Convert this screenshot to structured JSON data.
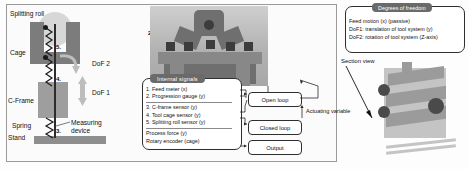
{
  "schematic": {
    "labels": {
      "splitting_roll": "Splitting roll",
      "cage": "Cage",
      "cframe": "C-Frame",
      "spring": "Spring",
      "stand": "Stand",
      "measuring_device": "Measuring device",
      "dof1": "DoF 1",
      "dof2": "DoF 2"
    },
    "callouts": {
      "n3": "3.",
      "n4": "4.",
      "n5": "5."
    }
  },
  "machine": {
    "gauge_number": "1.",
    "plate_callout": "2.",
    "axis_y": "Y",
    "axis_x": "X"
  },
  "internal_signals": {
    "title": "Internal signals",
    "group_a": [
      "1. Feed meter (x)",
      "2. Progression gauge (y)"
    ],
    "group_b": [
      "3. C-frame sensor (y)",
      "4. Tool cage sensor (y)",
      "5. Splitting roll sensor (y)"
    ],
    "group_c": [
      "Process force (y)",
      "Rotary encoder (cage)"
    ]
  },
  "flow": {
    "open_loop": "Open loop",
    "closed_loop": "Closed loop",
    "output": "Output",
    "actuating_variable": "Actuating variable"
  },
  "degrees_of_freedom": {
    "title": "Degrees of freedom",
    "items": [
      "Feed motion (x) (passive)",
      "DoF1: translation of tool system (y)",
      "DoF2: rotation of tool system (Z-axis)"
    ]
  },
  "section_view": {
    "label": "Section view"
  },
  "colors": {
    "badge": "#6a6a6a",
    "cage": "#7c7c7c",
    "cframe": "#9e9e9e",
    "stand": "#8e8e8e",
    "outline": "#2f2f2f"
  }
}
